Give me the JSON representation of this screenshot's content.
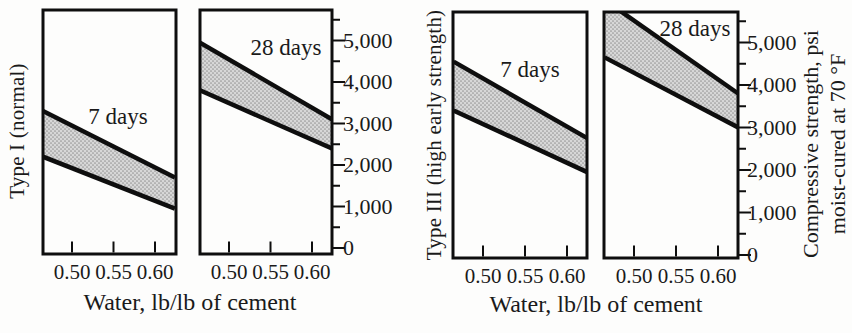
{
  "figure": {
    "x_axis_title": "Water, lb/lb of cement",
    "y_axis_title_line1": "Compressive strength, psi",
    "y_axis_title_line2": "moist-cured at 70 °F",
    "x_tick_labels": [
      "0.50",
      "0.55",
      "0.60"
    ],
    "y_tick_labels": [
      "0",
      "1,000",
      "2,000",
      "3,000",
      "4,000",
      "5,000"
    ]
  },
  "colors": {
    "ink": "#1a1a1a",
    "line": "#0e0e0e",
    "band_fill": "#d7d7d7",
    "band_dot": "#979797",
    "background": "#fdfdfc"
  },
  "chart_data": {
    "type": "area",
    "xlabel": "Water, lb/lb of cement",
    "ylabel": "Compressive strength, psi moist-cured at 70 °F",
    "xlim": [
      0.465,
      0.624
    ],
    "ylim": [
      0,
      5000
    ],
    "x_ticks": [
      0.5,
      0.55,
      0.6
    ],
    "y_ticks_major": [
      0,
      1000,
      2000,
      3000,
      4000,
      5000
    ],
    "y_minor_tick_interval": 500,
    "grid": false,
    "legend": "none",
    "group_labels": [
      "Type I (normal)",
      "Type III (high early strength)"
    ],
    "panels": [
      {
        "group": "Type I (normal)",
        "label": "7 days",
        "band": {
          "x": [
            0.465,
            0.624
          ],
          "upper_psi": [
            3300,
            1700
          ],
          "lower_psi": [
            2200,
            950
          ]
        }
      },
      {
        "group": "Type I (normal)",
        "label": "28 days",
        "band": {
          "x": [
            0.465,
            0.624
          ],
          "upper_psi": [
            4950,
            3100
          ],
          "lower_psi": [
            3800,
            2400
          ]
        }
      },
      {
        "group": "Type III (high early strength)",
        "label": "7 days",
        "band": {
          "x": [
            0.465,
            0.624
          ],
          "upper_psi": [
            4550,
            2750
          ],
          "lower_psi": [
            3400,
            1950
          ]
        }
      },
      {
        "group": "Type III (high early strength)",
        "label": "28 days",
        "band": {
          "x": [
            0.465,
            0.624
          ],
          "upper_psi": [
            6000,
            3800
          ],
          "lower_psi": [
            4650,
            3000
          ]
        }
      }
    ]
  }
}
